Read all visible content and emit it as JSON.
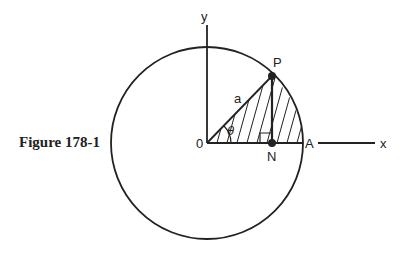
{
  "figure": {
    "caption": "Figure 178-1",
    "labels": {
      "y_axis": "y",
      "x_axis": "x",
      "origin": "0",
      "point_p": "P",
      "point_n": "N",
      "point_a": "A",
      "radius": "a",
      "angle": "θ"
    }
  }
}
